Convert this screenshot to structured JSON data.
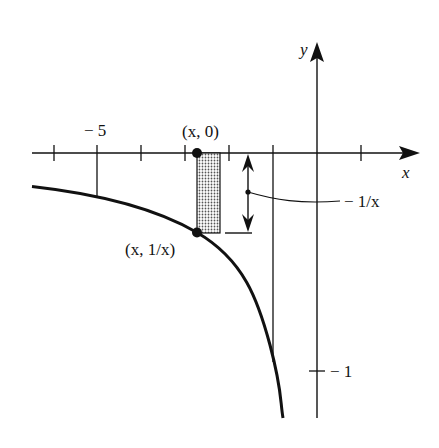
{
  "diagram": {
    "function": "y = 1/x",
    "axes": {
      "x_label": "x",
      "y_label": "y",
      "x_tick_label": "− 5",
      "y_tick_label": "− 1"
    },
    "points": [
      {
        "label": "(x, 0)"
      },
      {
        "label": "(x, 1/x)"
      }
    ],
    "annotation": {
      "height_label": "− 1/x"
    },
    "colors": {
      "ink": "#111111",
      "background": "#ffffff",
      "shading": "#bdbdbd"
    }
  }
}
